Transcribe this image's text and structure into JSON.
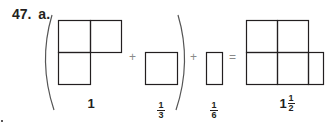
{
  "problem": {
    "number": "47.",
    "part": "a."
  },
  "operators": {
    "plus1": "+",
    "plus2": "+",
    "equals": "="
  },
  "terms": [
    {
      "name": "one",
      "whole": "1",
      "shape": "L-shape of 3 unit squares"
    },
    {
      "name": "one-third",
      "numerator": "1",
      "denominator": "3",
      "shape": "1 unit square"
    },
    {
      "name": "one-sixth",
      "numerator": "1",
      "denominator": "6",
      "shape": "half-width rectangle"
    },
    {
      "name": "result",
      "whole": "1",
      "numerator": "1",
      "denominator": "2",
      "shape": "4 unit squares + half-width rectangle"
    }
  ],
  "colors": {
    "stroke": "#231f20",
    "operator": "#8a8a8a",
    "paren": "#555555"
  }
}
